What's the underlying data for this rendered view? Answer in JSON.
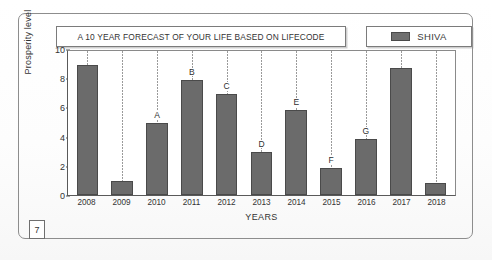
{
  "figure": {
    "badge_number": "7",
    "legend": {
      "label": "SHIVA",
      "swatch_color": "#6b6b6b"
    },
    "title_box": "A 10 YEAR FORECAST OF YOUR LIFE BASED ON LIFECODE"
  },
  "chart_data": {
    "type": "bar",
    "title": "A 10 YEAR FORECAST OF YOUR LIFE BASED ON LIFECODE",
    "xlabel": "YEARS",
    "ylabel": "Prosperity level",
    "ylim": [
      0,
      10
    ],
    "yticks": [
      "0",
      "2",
      "4",
      "6",
      "8",
      "10"
    ],
    "grid": "vertical-dotted",
    "legend_position": "top-right",
    "categories": [
      "2008",
      "2009",
      "2010",
      "2011",
      "2012",
      "2013",
      "2014",
      "2015",
      "2016",
      "2017",
      "2018"
    ],
    "series": [
      {
        "name": "SHIVA",
        "color": "#6b6b6b",
        "values": [
          9.0,
          1.0,
          5.0,
          8.0,
          7.0,
          3.0,
          5.9,
          1.9,
          3.9,
          8.8,
          0.8
        ]
      }
    ],
    "point_labels": [
      "",
      "",
      "A",
      "B",
      "C",
      "D",
      "E",
      "F",
      "G",
      "",
      ""
    ]
  }
}
